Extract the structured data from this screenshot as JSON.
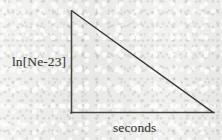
{
  "figure": {
    "name": "radioactive-decay-semilog-plot",
    "background_color": "#e9e9e7",
    "ink_color": "#3a3a38",
    "width": 222,
    "height": 140
  },
  "chart_data": {
    "type": "line",
    "title": "",
    "subtitle": "",
    "xlabel": "seconds",
    "ylabel": "ln[Ne-23]",
    "grid": false,
    "legend": null,
    "legend_position": "none",
    "x_tick_labels": [],
    "y_tick_labels": [],
    "xlim": [
      0,
      1
    ],
    "ylim": [
      0,
      1
    ],
    "annotations": [],
    "series": [
      {
        "name": "ln[Ne-23] decay",
        "x": [
          0,
          1
        ],
        "y": [
          1,
          0
        ],
        "description": "straight descending line from top of y-axis to right end of x-axis",
        "color": "#3a3a38"
      }
    ],
    "axes": {
      "y_axis": {
        "x": 71.5,
        "y_top": 11,
        "y_bottom": 113
      },
      "x_axis": {
        "y": 112.5,
        "x_left": 71,
        "x_right": 214
      }
    }
  },
  "labels": {
    "y_axis": "ln[Ne-23]",
    "x_axis": "seconds"
  }
}
